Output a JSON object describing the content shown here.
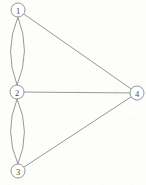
{
  "figure": {
    "background_color": "#fdfdfc",
    "stroke_color": "#8c8c8c",
    "node_fill_color": "#ffffff",
    "label_color": "#4a4a4a",
    "width": 146,
    "height": 185
  },
  "chart_data": {
    "type": "diagram",
    "graph_type": "undirected multigraph",
    "title": "",
    "node_count": 4,
    "edge_count": 7,
    "nodes": [
      {
        "id": "1",
        "label": "1",
        "x": 18,
        "y": 10,
        "r": 7
      },
      {
        "id": "2",
        "label": "2",
        "x": 17,
        "y": 92,
        "r": 7
      },
      {
        "id": "3",
        "label": "3",
        "x": 18,
        "y": 171,
        "r": 7
      },
      {
        "id": "4",
        "label": "4",
        "x": 137,
        "y": 93,
        "r": 7
      }
    ],
    "edges": [
      {
        "source": "1",
        "target": "2",
        "style": "curved",
        "bow": -7,
        "multiplicity_index": 1
      },
      {
        "source": "1",
        "target": "2",
        "style": "curved",
        "bow": 7,
        "multiplicity_index": 2
      },
      {
        "source": "2",
        "target": "3",
        "style": "curved",
        "bow": -7,
        "multiplicity_index": 1
      },
      {
        "source": "2",
        "target": "3",
        "style": "curved",
        "bow": 7,
        "multiplicity_index": 2
      },
      {
        "source": "1",
        "target": "4",
        "style": "straight",
        "bow": 0,
        "multiplicity_index": 1
      },
      {
        "source": "2",
        "target": "4",
        "style": "straight",
        "bow": 0,
        "multiplicity_index": 1
      },
      {
        "source": "3",
        "target": "4",
        "style": "straight",
        "bow": 0,
        "multiplicity_index": 1
      }
    ],
    "adjacency_summary": [
      {
        "pair": "1-2",
        "count": 2
      },
      {
        "pair": "2-3",
        "count": 2
      },
      {
        "pair": "1-4",
        "count": 1
      },
      {
        "pair": "2-4",
        "count": 1
      },
      {
        "pair": "3-4",
        "count": 1
      }
    ],
    "degrees": [
      {
        "node": "1",
        "degree": 3
      },
      {
        "node": "2",
        "degree": 5
      },
      {
        "node": "3",
        "degree": 3
      },
      {
        "node": "4",
        "degree": 3
      }
    ]
  }
}
